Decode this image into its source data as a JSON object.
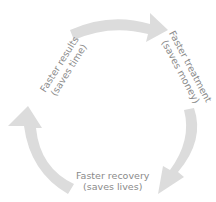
{
  "diagram": {
    "type": "cycle",
    "arrow_color": "#dcdcdc",
    "text_color": "#8a8a8a",
    "nodes": [
      {
        "label": "Faster results",
        "sublabel": "(saves time)"
      },
      {
        "label": "Faster treatment",
        "sublabel": "(saves money)"
      },
      {
        "label": "Faster recovery",
        "sublabel": "(saves lives)"
      }
    ],
    "edges": [
      {
        "from": "Faster results",
        "to": "Faster treatment"
      },
      {
        "from": "Faster treatment",
        "to": "Faster recovery"
      },
      {
        "from": "Faster recovery",
        "to": "Faster results"
      }
    ]
  }
}
